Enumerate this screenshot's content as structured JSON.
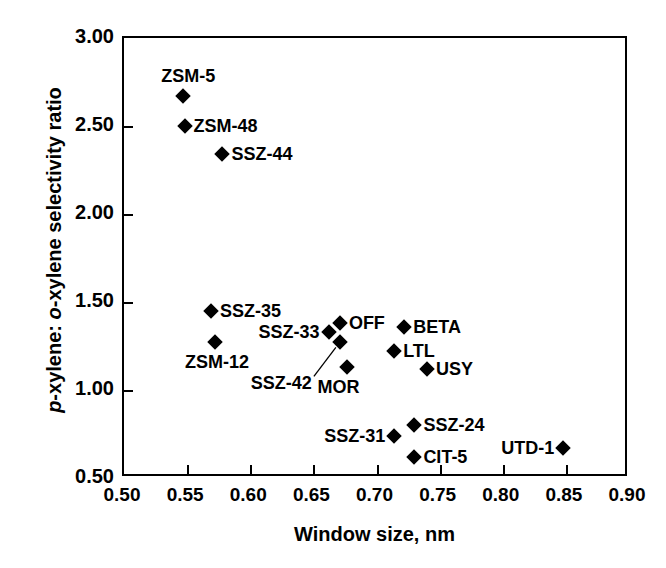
{
  "chart_data": {
    "type": "scatter",
    "title": "",
    "xlabel": "Window size, nm",
    "ylabel": "p-xylene: o-xylene selectivity ratio",
    "ylabel_parts": {
      "p_italic": "p",
      "mid": "-xylene: ",
      "o_italic": "o",
      "tail": "-xylene selectivity ratio"
    },
    "xlim": [
      0.5,
      0.9
    ],
    "ylim": [
      0.5,
      3.0
    ],
    "xticks": [
      0.5,
      0.55,
      0.6,
      0.65,
      0.7,
      0.75,
      0.8,
      0.85,
      0.9
    ],
    "xtick_labels": [
      "0.50",
      "0.55",
      "0.60",
      "0.65",
      "0.70",
      "0.75",
      "0.80",
      "0.85",
      "0.90"
    ],
    "yticks": [
      0.5,
      1.0,
      1.5,
      2.0,
      2.5,
      3.0
    ],
    "ytick_labels": [
      "0.50",
      "1.00",
      "1.50",
      "2.00",
      "2.50",
      "3.00"
    ],
    "grid": false,
    "legend": "none",
    "marker_style": "filled-diamond",
    "marker_color": "#000000",
    "points": [
      {
        "label": "ZSM-5",
        "x": 0.547,
        "y": 2.67,
        "label_pos": "above"
      },
      {
        "label": "ZSM-48",
        "x": 0.548,
        "y": 2.5,
        "label_pos": "right"
      },
      {
        "label": "SSZ-44",
        "x": 0.578,
        "y": 2.34,
        "label_pos": "right"
      },
      {
        "label": "SSZ-35",
        "x": 0.569,
        "y": 1.45,
        "label_pos": "right"
      },
      {
        "label": "ZSM-12",
        "x": 0.572,
        "y": 1.27,
        "label_pos": "below"
      },
      {
        "label": "SSZ-33",
        "x": 0.662,
        "y": 1.33,
        "label_pos": "left"
      },
      {
        "label": "OFF",
        "x": 0.671,
        "y": 1.38,
        "label_pos": "right"
      },
      {
        "label": "SSZ-42",
        "x": 0.671,
        "y": 1.27,
        "label_pos": "leader"
      },
      {
        "label": "MOR",
        "x": 0.677,
        "y": 1.13,
        "label_pos": "below"
      },
      {
        "label": "BETA",
        "x": 0.722,
        "y": 1.36,
        "label_pos": "right"
      },
      {
        "label": "LTL",
        "x": 0.714,
        "y": 1.22,
        "label_pos": "right"
      },
      {
        "label": "USY",
        "x": 0.74,
        "y": 1.12,
        "label_pos": "right"
      },
      {
        "label": "SSZ-31",
        "x": 0.714,
        "y": 0.74,
        "label_pos": "left"
      },
      {
        "label": "SSZ-24",
        "x": 0.73,
        "y": 0.8,
        "label_pos": "right"
      },
      {
        "label": "CIT-5",
        "x": 0.73,
        "y": 0.62,
        "label_pos": "right"
      },
      {
        "label": "UTD-1",
        "x": 0.848,
        "y": 0.67,
        "label_pos": "left"
      }
    ]
  }
}
